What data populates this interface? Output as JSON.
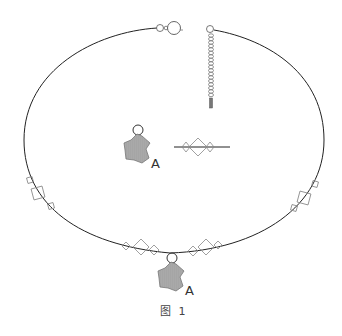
{
  "diagram": {
    "type": "necklace-assembly-illustration",
    "caption": "图 1",
    "parts": {
      "pendant_label_top": "A",
      "pendant_label_bottom": "A"
    },
    "colors": {
      "wire": "#222222",
      "bead_outline": "#888888",
      "star_fill": "#a9a9a9",
      "star_stroke": "#777777",
      "ring_stroke": "#333333",
      "chain_stroke": "#666666",
      "background": "#ffffff"
    }
  }
}
